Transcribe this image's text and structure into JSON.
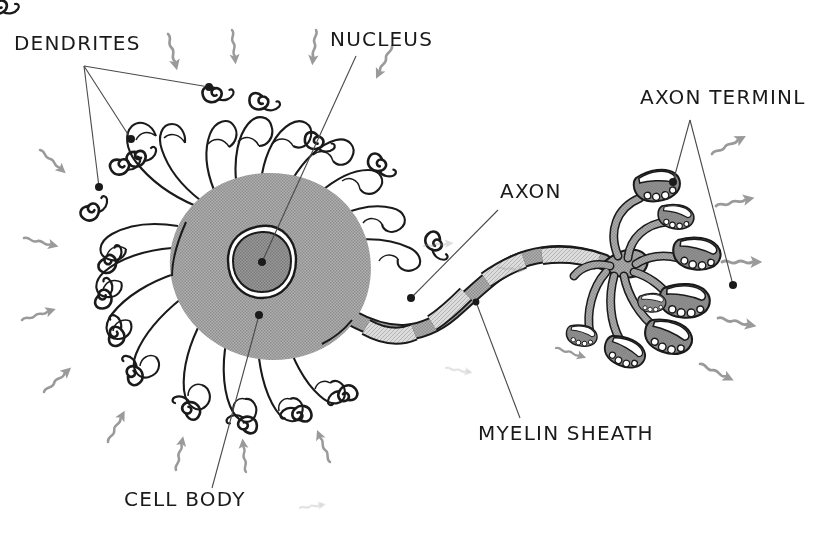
{
  "figure": {
    "style": "hand-drawn black and white line art with grey halftone shading",
    "width": 830,
    "height": 538,
    "background_color": "#ffffff"
  },
  "colors": {
    "ink": "#1a1a1a",
    "soma_fill": "#a8a8a8",
    "nucleus_fill": "#8f8f8f",
    "nucleus_halo": "#ffffff",
    "axon_fill": "#9e9e9e",
    "myelin_fill": "#d5d5d5",
    "terminal_fill": "#8c8c8c",
    "arrow_grey": "#9a9a9a",
    "leader_line": "#4a4a4a"
  },
  "labels": [
    {
      "id": "dendrites",
      "text": "DENDRITES",
      "x": 14,
      "y": 50,
      "anchor": "start"
    },
    {
      "id": "nucleus",
      "text": "NUCLEUS",
      "x": 330,
      "y": 46,
      "anchor": "start"
    },
    {
      "id": "axon_terminal",
      "text": "AXON TERMINL",
      "x": 640,
      "y": 104,
      "anchor": "start"
    },
    {
      "id": "axon",
      "text": "AXON",
      "x": 500,
      "y": 198,
      "anchor": "start"
    },
    {
      "id": "myelin_sheath",
      "text": "MYELIN SHEATH",
      "x": 478,
      "y": 440,
      "anchor": "start"
    },
    {
      "id": "cell_body",
      "text": "CELL BODY",
      "x": 124,
      "y": 506,
      "anchor": "start"
    }
  ],
  "leaders": {
    "dendrites": {
      "vertex": {
        "x": 84,
        "y": 66
      },
      "targets": [
        {
          "x": 209,
          "y": 87
        },
        {
          "x": 131,
          "y": 139
        },
        {
          "x": 99,
          "y": 187
        }
      ]
    },
    "nucleus": {
      "from": {
        "x": 356,
        "y": 56
      },
      "to": {
        "x": 262,
        "y": 262
      }
    },
    "axon": {
      "from": {
        "x": 498,
        "y": 210
      },
      "to": {
        "x": 411,
        "y": 298
      }
    },
    "myelin": {
      "from": {
        "x": 520,
        "y": 418
      },
      "to": {
        "x": 476,
        "y": 302
      }
    },
    "cell_body": {
      "from": {
        "x": 212,
        "y": 488
      },
      "to": {
        "x": 259,
        "y": 315
      }
    },
    "axon_terminal": {
      "vertex": {
        "x": 690,
        "y": 120
      },
      "targets": [
        {
          "x": 673,
          "y": 182
        },
        {
          "x": 733,
          "y": 285
        }
      ]
    }
  },
  "anatomy": {
    "soma": {
      "label": "cell body (soma)",
      "cx": 265,
      "cy": 265,
      "rx": 104,
      "ry": 92
    },
    "nucleus": {
      "label": "nucleus",
      "cx": 262,
      "cy": 262,
      "rx": 33,
      "ry": 36
    },
    "nucleolus": {
      "label": "nucleolus",
      "cx": 262,
      "cy": 262,
      "r": 3.6
    },
    "dendrite_count": 18,
    "dendrite_spine_count": 18,
    "axon": {
      "label": "axon",
      "myelin_segment_count": 4,
      "node_count": 4
    },
    "terminal_branch_count": 8,
    "terminal_bulb_count": 8,
    "input_arrow_count": 12,
    "output_arrow_count": 6
  },
  "signal_arrows": {
    "input_description": "grey squiggly arrows pointing inward toward dendrites",
    "output_description": "grey squiggly arrows pointing outward from axon terminals"
  }
}
